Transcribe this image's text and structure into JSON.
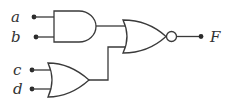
{
  "diagram": {
    "type": "logic-circuit",
    "inputs": [
      {
        "id": "a",
        "label": "a"
      },
      {
        "id": "b",
        "label": "b"
      },
      {
        "id": "c",
        "label": "c"
      },
      {
        "id": "d",
        "label": "d"
      }
    ],
    "gates": [
      {
        "id": "g1",
        "type": "AND",
        "inputs": [
          "a",
          "b"
        ]
      },
      {
        "id": "g2",
        "type": "OR",
        "inputs": [
          "c",
          "d"
        ]
      },
      {
        "id": "g3",
        "type": "NOR",
        "inputs": [
          "g1",
          "g2"
        ]
      }
    ],
    "output": {
      "id": "F",
      "label": "F",
      "from": "g3"
    },
    "colors": {
      "line": "#3a3a3a",
      "text": "#333333",
      "background": "#ffffff"
    }
  }
}
